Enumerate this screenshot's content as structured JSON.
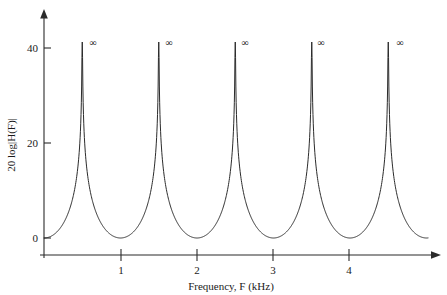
{
  "chart_data": {
    "type": "line",
    "title": "",
    "subtitle": "",
    "xlabel": "Frequency, F (kHz)",
    "ylabel": "20 log|H(F)|",
    "xlim": [
      0,
      5.2
    ],
    "ylim": [
      -2,
      46
    ],
    "xticks": [
      1,
      2,
      3,
      4
    ],
    "xticklabels": [
      "1",
      "2",
      "3",
      "4"
    ],
    "yticks": [
      0,
      20,
      40
    ],
    "yticklabels": [
      "0",
      "20",
      "40"
    ],
    "grid": false,
    "legend": null,
    "series": [
      {
        "name": "20 log|H(F)|",
        "description": "Resonant comb magnitude response with poles on the unit circle; magnitude diverges at the resonant frequencies and falls to 0 dB midway between them.",
        "poles_khz": [
          0.5,
          1.5,
          2.5,
          3.5,
          4.5
        ],
        "zeros_khz": [
          0.0,
          1.0,
          2.0,
          3.0,
          4.0,
          5.0
        ],
        "minimum_db": 0,
        "peak_db": "infinite",
        "x": [
          0.0,
          0.1,
          0.2,
          0.25,
          0.3,
          0.35,
          0.4,
          0.43,
          0.46,
          0.48,
          0.5,
          0.52,
          0.54,
          0.57,
          0.6,
          0.65,
          0.7,
          0.75,
          0.8,
          0.9,
          1.0,
          1.1,
          1.2,
          1.25,
          1.3,
          1.35,
          1.4,
          1.43,
          1.46,
          1.48,
          1.5,
          1.52,
          1.54,
          1.57,
          1.6,
          1.65,
          1.7,
          1.75,
          1.8,
          1.9,
          2.0,
          2.1,
          2.2,
          2.25,
          2.3,
          2.35,
          2.4,
          2.43,
          2.46,
          2.48,
          2.5,
          2.52,
          2.54,
          2.57,
          2.6,
          2.65,
          2.7,
          2.75,
          2.8,
          2.9,
          3.0,
          3.1,
          3.2,
          3.25,
          3.3,
          3.35,
          3.4,
          3.43,
          3.46,
          3.48,
          3.5,
          3.52,
          3.54,
          3.57,
          3.6,
          3.65,
          3.7,
          3.75,
          3.8,
          3.9,
          4.0,
          4.1,
          4.2,
          4.25,
          4.3,
          4.35,
          4.4,
          4.43,
          4.46,
          4.48,
          4.5,
          4.52,
          4.54,
          4.57,
          4.6,
          4.65,
          4.7,
          4.75,
          4.8,
          4.9,
          5.0
        ],
        "y": [
          0,
          1.2,
          4.6,
          7.0,
          10.0,
          13.8,
          18.6,
          22.6,
          28.2,
          33.4,
          46,
          33.4,
          28.2,
          22.6,
          18.6,
          13.8,
          10.0,
          7.0,
          4.6,
          1.2,
          0,
          1.2,
          4.6,
          7.0,
          10.0,
          13.8,
          18.6,
          22.6,
          28.2,
          33.4,
          46,
          33.4,
          28.2,
          22.6,
          18.6,
          13.8,
          10.0,
          7.0,
          4.6,
          1.2,
          0,
          1.2,
          4.6,
          7.0,
          10.0,
          13.8,
          18.6,
          22.6,
          28.2,
          33.4,
          46,
          33.4,
          28.2,
          22.6,
          18.6,
          13.8,
          10.0,
          7.0,
          4.6,
          1.2,
          0,
          1.2,
          4.6,
          7.0,
          10.0,
          13.8,
          18.6,
          22.6,
          28.2,
          33.4,
          46,
          33.4,
          28.2,
          22.6,
          18.6,
          13.8,
          10.0,
          7.0,
          4.6,
          1.2,
          0,
          1.2,
          4.6,
          7.0,
          10.0,
          13.8,
          18.6,
          22.6,
          28.2,
          33.4,
          46,
          33.4,
          28.2,
          22.6,
          18.6,
          13.8,
          10.0,
          7.0,
          4.6,
          1.2,
          0
        ]
      }
    ],
    "annotations": [
      {
        "label": "∞",
        "x_khz": 0.5,
        "y_db": 42
      },
      {
        "label": "∞",
        "x_khz": 1.5,
        "y_db": 42
      },
      {
        "label": "∞",
        "x_khz": 2.5,
        "y_db": 42
      },
      {
        "label": "∞",
        "x_khz": 3.5,
        "y_db": 42
      },
      {
        "label": "∞",
        "x_khz": 4.5,
        "y_db": 42
      }
    ],
    "colors": {
      "curve": "#2b2b2b",
      "axis": "#2b2b2b",
      "text": "#1a1a1a",
      "background": "#ffffff"
    }
  },
  "axes": {
    "x": {
      "title": "Frequency, F (kHz)",
      "ticks": [
        {
          "label": "1"
        },
        {
          "label": "2"
        },
        {
          "label": "3"
        },
        {
          "label": "4"
        }
      ]
    },
    "y": {
      "title": "20 log|H(F)|",
      "ticks": [
        {
          "label": "40"
        },
        {
          "label": "20"
        },
        {
          "label": "0"
        }
      ]
    }
  },
  "peak_markers": [
    {
      "label": "∞"
    },
    {
      "label": "∞"
    },
    {
      "label": "∞"
    },
    {
      "label": "∞"
    },
    {
      "label": "∞"
    }
  ]
}
